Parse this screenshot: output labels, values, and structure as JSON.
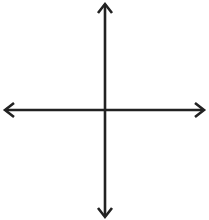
{
  "problem": {
    "label": "c)  y  =  2x  –  3"
  },
  "chart_data": {
    "type": "line",
    "grid": true,
    "grid_columns": 16,
    "grid_rows": 17,
    "axes": {
      "x_axis_arrows": true,
      "y_axis_arrows": true
    },
    "xlabel": "",
    "ylabel": "",
    "series": []
  },
  "colors": {
    "grid": "#9a9a9a",
    "axis": "#222222",
    "background": "#ffffff"
  }
}
